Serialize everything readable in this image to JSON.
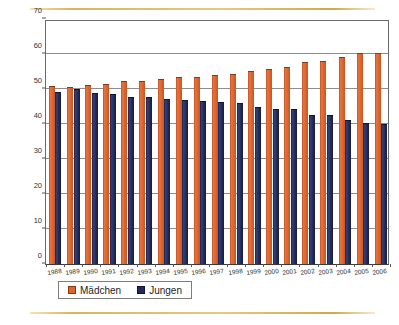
{
  "figure": {
    "ylabel": "Kinder in Prozent",
    "top_rule_color": "#d8b55a",
    "bottom_rule_color": "#d8b55a"
  },
  "legend": {
    "position": "bottom-left",
    "items": [
      {
        "label": "Mädchen",
        "color": "#dd6630",
        "swatch": "legend-swatch-girls"
      },
      {
        "label": "Jungen",
        "color": "#222a58",
        "swatch": "legend-swatch-boys"
      }
    ]
  },
  "chart_data": {
    "type": "bar",
    "title": "",
    "xlabel": "",
    "ylabel": "Kinder in Prozent",
    "ylim": [
      0,
      70
    ],
    "yticks": [
      0,
      10,
      20,
      30,
      40,
      50,
      60,
      70
    ],
    "grid": true,
    "legend_position": "bottom-left",
    "categories": [
      "1988",
      "1989",
      "1990",
      "1991",
      "1992",
      "1993",
      "1994",
      "1995",
      "1996",
      "1997",
      "1998",
      "1999",
      "2000",
      "2001",
      "2002",
      "2003",
      "2004",
      "2005",
      "2006"
    ],
    "series": [
      {
        "name": "Mädchen",
        "color": "#dd6630",
        "values": [
          50.8,
          50.5,
          51.2,
          51.5,
          52.3,
          52.3,
          52.9,
          53.3,
          53.5,
          54.0,
          54.3,
          55.2,
          55.8,
          56.3,
          57.6,
          58.0,
          59.2,
          60.3,
          60.2
        ]
      },
      {
        "name": "Jungen",
        "color": "#222a58",
        "values": [
          49.2,
          50.0,
          48.8,
          48.5,
          47.7,
          47.7,
          47.2,
          46.9,
          46.7,
          46.2,
          46.1,
          45.0,
          44.4,
          44.2,
          42.6,
          42.7,
          41.1,
          40.3,
          39.9
        ]
      }
    ]
  }
}
